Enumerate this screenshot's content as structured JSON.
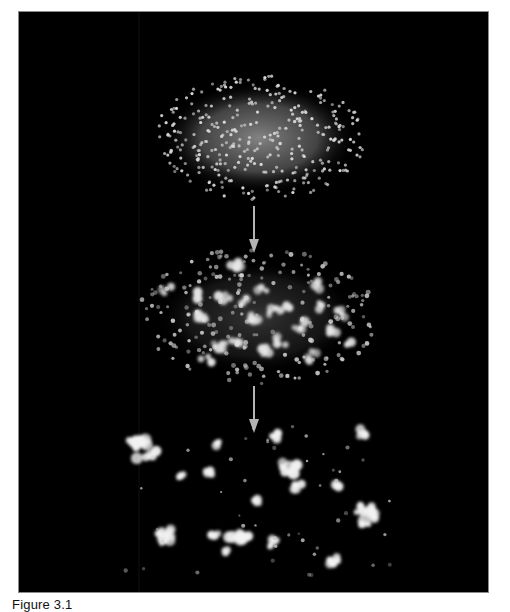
{
  "figure": {
    "caption": "Figure 3.1",
    "panel_background": "#000000",
    "particle_color": "#e8e8e8",
    "arrow_color": "#b4b4b4",
    "stages": [
      {
        "name": "uniform-cloud",
        "description": "Uniform ellipsoidal distribution of particles with diffuse glow"
      },
      {
        "name": "fragmenting-cloud",
        "description": "Particles begin clumping into small groups within fading glow"
      },
      {
        "name": "clusters",
        "description": "Distinct bright clusters separated by dark space"
      }
    ],
    "arrows": [
      {
        "from": "uniform-cloud",
        "to": "fragmenting-cloud"
      },
      {
        "from": "fragmenting-cloud",
        "to": "clusters"
      }
    ]
  }
}
